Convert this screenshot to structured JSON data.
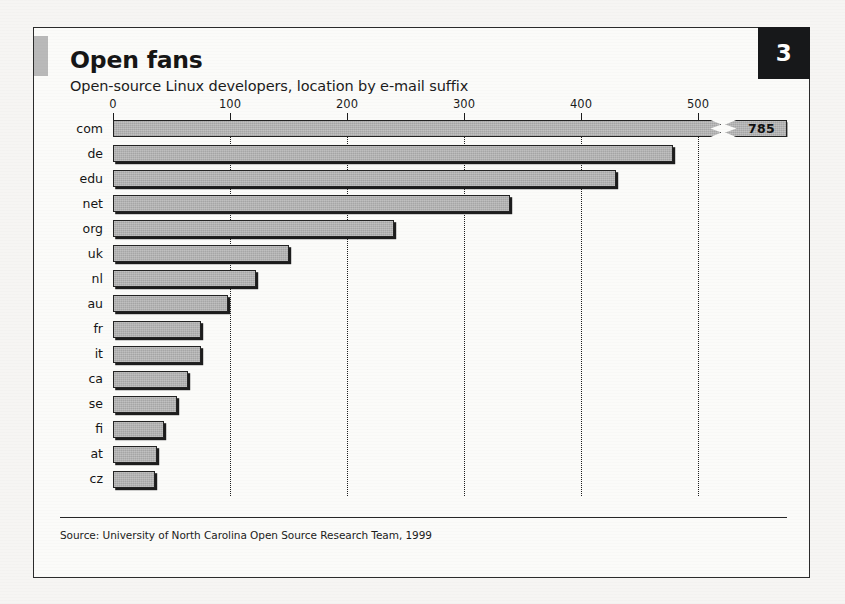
{
  "page": {
    "number": "3",
    "title": "Open fans",
    "subtitle": "Open-source Linux developers, location by e-mail suffix",
    "source": "Source: University of North Carolina Open Source Research Team, 1999"
  },
  "colors": {
    "bar_fill": "#a6a6a6",
    "bar_outline": "#232323",
    "page_number_bg": "#17181a",
    "grid": "#1d1d1d",
    "card_bg": "#fbfbf9"
  },
  "chart_data": {
    "type": "bar",
    "orientation": "horizontal",
    "title": "Open fans",
    "subtitle": "Open-source Linux developers, location by e-mail suffix",
    "xlabel": "",
    "ylabel": "",
    "xlim": [
      0,
      500
    ],
    "grid": true,
    "legend": null,
    "axis_ticks": [
      "0",
      "100",
      "200",
      "300",
      "400",
      "500"
    ],
    "axis_tick_values": [
      0,
      100,
      200,
      300,
      400,
      500
    ],
    "categories": [
      "com",
      "de",
      "edu",
      "net",
      "org",
      "uk",
      "nl",
      "au",
      "fr",
      "it",
      "ca",
      "se",
      "fi",
      "at",
      "cz"
    ],
    "values": [
      785,
      479,
      430,
      339,
      240,
      150,
      122,
      98,
      75,
      75,
      64,
      55,
      44,
      38,
      36
    ],
    "clipped_bars": [
      {
        "category": "com",
        "value": 785,
        "label": "785",
        "drawn_to": 520,
        "note": "bar broken with zigzag, value shown in detached chip"
      }
    ],
    "value_labels": {
      "com": "785"
    }
  }
}
